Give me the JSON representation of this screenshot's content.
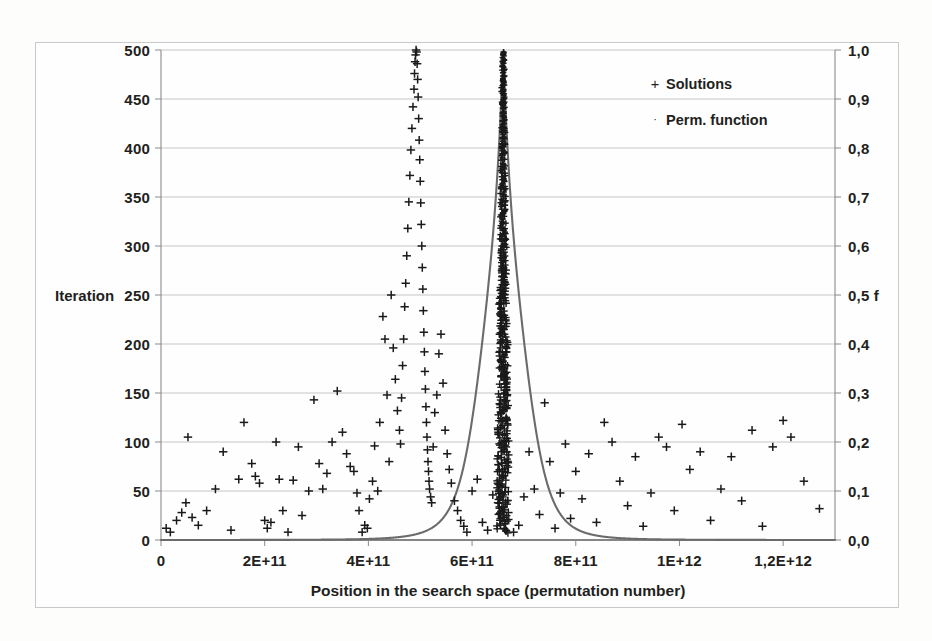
{
  "chart_data": {
    "type": "scatter",
    "title": "",
    "subtitle": "",
    "xlabel": "Position in the search space (permutation number)",
    "ylabel": "Iteration",
    "y2label": "f",
    "xlim": [
      0,
      1300000000000
    ],
    "ylim": [
      0,
      500
    ],
    "y2lim": [
      0,
      1.0
    ],
    "grid": true,
    "legend_position": "top-right",
    "xticks": [
      "0",
      "2E+11",
      "4E+11",
      "6E+11",
      "8E+11",
      "1E+12",
      "1,2E+12"
    ],
    "xtick_values": [
      0,
      200000000000,
      400000000000,
      600000000000,
      800000000000,
      1000000000000,
      1200000000000
    ],
    "yticks": [
      "0",
      "50",
      "100",
      "150",
      "200",
      "250",
      "300",
      "350",
      "400",
      "450",
      "500"
    ],
    "ytick_values": [
      0,
      50,
      100,
      150,
      200,
      250,
      300,
      350,
      400,
      450,
      500
    ],
    "y2ticks": [
      "0,0",
      "0,1",
      "0,2",
      "0,3",
      "0,4",
      "0,5 f",
      "0,6",
      "0,7",
      "0,8",
      "0,9",
      "1,0"
    ],
    "y2tick_values": [
      0.0,
      0.1,
      0.2,
      0.3,
      0.4,
      0.5,
      0.6,
      0.7,
      0.8,
      0.9,
      1.0
    ],
    "legend": [
      {
        "label": "Solutions",
        "marker": "+",
        "color": "#1a1a1a"
      },
      {
        "label": "Perm. function",
        "marker": "·",
        "color": "#5a5a5a"
      }
    ],
    "series": [
      {
        "name": "Solutions",
        "type": "scatter",
        "marker": "+",
        "color": "#1a1a1a",
        "axis": "left",
        "points": [
          [
            10000000000,
            12
          ],
          [
            18000000000,
            8
          ],
          [
            30000000000,
            20
          ],
          [
            40000000000,
            28
          ],
          [
            48000000000,
            38
          ],
          [
            52000000000,
            105
          ],
          [
            60000000000,
            23
          ],
          [
            72000000000,
            15
          ],
          [
            88000000000,
            30
          ],
          [
            105000000000,
            52
          ],
          [
            120000000000,
            90
          ],
          [
            135000000000,
            10
          ],
          [
            150000000000,
            62
          ],
          [
            160000000000,
            120
          ],
          [
            175000000000,
            78
          ],
          [
            182000000000,
            65
          ],
          [
            190000000000,
            58
          ],
          [
            200000000000,
            20
          ],
          [
            205000000000,
            12
          ],
          [
            212000000000,
            18
          ],
          [
            222000000000,
            100
          ],
          [
            228000000000,
            62
          ],
          [
            235000000000,
            30
          ],
          [
            245000000000,
            8
          ],
          [
            255000000000,
            61
          ],
          [
            265000000000,
            95
          ],
          [
            272000000000,
            25
          ],
          [
            285000000000,
            50
          ],
          [
            295000000000,
            143
          ],
          [
            305000000000,
            78
          ],
          [
            312000000000,
            52
          ],
          [
            320000000000,
            68
          ],
          [
            330000000000,
            100
          ],
          [
            340000000000,
            152
          ],
          [
            350000000000,
            110
          ],
          [
            358000000000,
            88
          ],
          [
            365000000000,
            75
          ],
          [
            372000000000,
            70
          ],
          [
            378000000000,
            48
          ],
          [
            382000000000,
            30
          ],
          [
            388000000000,
            8
          ],
          [
            393000000000,
            15
          ],
          [
            398000000000,
            12
          ],
          [
            402000000000,
            42
          ],
          [
            408000000000,
            60
          ],
          [
            412000000000,
            96
          ],
          [
            418000000000,
            50
          ],
          [
            422000000000,
            120
          ],
          [
            428000000000,
            228
          ],
          [
            432000000000,
            205
          ],
          [
            436000000000,
            148
          ],
          [
            440000000000,
            80
          ],
          [
            444000000000,
            250
          ],
          [
            448000000000,
            196
          ],
          [
            452000000000,
            164
          ],
          [
            456000000000,
            132
          ],
          [
            460000000000,
            112
          ],
          [
            462000000000,
            98
          ],
          [
            464000000000,
            145
          ],
          [
            466000000000,
            178
          ],
          [
            468000000000,
            205
          ],
          [
            470000000000,
            238
          ],
          [
            472000000000,
            262
          ],
          [
            474000000000,
            290
          ],
          [
            476000000000,
            318
          ],
          [
            478000000000,
            345
          ],
          [
            480000000000,
            372
          ],
          [
            482000000000,
            398
          ],
          [
            484000000000,
            420
          ],
          [
            486000000000,
            442
          ],
          [
            488000000000,
            460
          ],
          [
            489000000000,
            476
          ],
          [
            490000000000,
            488
          ],
          [
            491000000000,
            495
          ],
          [
            492000000000,
            500
          ],
          [
            493000000000,
            498
          ],
          [
            494000000000,
            486
          ],
          [
            495000000000,
            470
          ],
          [
            496000000000,
            452
          ],
          [
            497000000000,
            430
          ],
          [
            498000000000,
            408
          ],
          [
            499000000000,
            388
          ],
          [
            500000000000,
            366
          ],
          [
            501000000000,
            344
          ],
          [
            502000000000,
            322
          ],
          [
            503000000000,
            300
          ],
          [
            504000000000,
            278
          ],
          [
            505000000000,
            256
          ],
          [
            506000000000,
            234
          ],
          [
            507000000000,
            212
          ],
          [
            508000000000,
            192
          ],
          [
            509000000000,
            172
          ],
          [
            510000000000,
            154
          ],
          [
            511000000000,
            136
          ],
          [
            512000000000,
            120
          ],
          [
            513000000000,
            105
          ],
          [
            514000000000,
            92
          ],
          [
            515000000000,
            80
          ],
          [
            516000000000,
            70
          ],
          [
            517000000000,
            60
          ],
          [
            518000000000,
            52
          ],
          [
            520000000000,
            44
          ],
          [
            522000000000,
            38
          ],
          [
            525000000000,
            95
          ],
          [
            528000000000,
            130
          ],
          [
            532000000000,
            148
          ],
          [
            536000000000,
            190
          ],
          [
            540000000000,
            210
          ],
          [
            544000000000,
            160
          ],
          [
            548000000000,
            112
          ],
          [
            552000000000,
            88
          ],
          [
            556000000000,
            72
          ],
          [
            560000000000,
            58
          ],
          [
            566000000000,
            40
          ],
          [
            572000000000,
            30
          ],
          [
            578000000000,
            20
          ],
          [
            584000000000,
            14
          ],
          [
            590000000000,
            8
          ],
          [
            600000000000,
            50
          ],
          [
            610000000000,
            62
          ],
          [
            620000000000,
            18
          ],
          [
            630000000000,
            10
          ],
          [
            640000000000,
            46
          ],
          [
            650000000000,
            38
          ],
          [
            660000000000,
            132
          ],
          [
            670000000000,
            28
          ],
          [
            680000000000,
            8
          ],
          [
            690000000000,
            15
          ],
          [
            700000000000,
            44
          ],
          [
            710000000000,
            90
          ],
          [
            720000000000,
            52
          ],
          [
            730000000000,
            26
          ],
          [
            740000000000,
            140
          ],
          [
            750000000000,
            80
          ],
          [
            760000000000,
            12
          ],
          [
            770000000000,
            48
          ],
          [
            780000000000,
            98
          ],
          [
            790000000000,
            22
          ],
          [
            800000000000,
            70
          ],
          [
            812000000000,
            42
          ],
          [
            825000000000,
            88
          ],
          [
            840000000000,
            18
          ],
          [
            855000000000,
            120
          ],
          [
            870000000000,
            100
          ],
          [
            885000000000,
            60
          ],
          [
            900000000000,
            35
          ],
          [
            915000000000,
            85
          ],
          [
            930000000000,
            14
          ],
          [
            945000000000,
            48
          ],
          [
            960000000000,
            105
          ],
          [
            975000000000,
            95
          ],
          [
            990000000000,
            30
          ],
          [
            1005000000000,
            118
          ],
          [
            1020000000000,
            72
          ],
          [
            1040000000000,
            90
          ],
          [
            1060000000000,
            20
          ],
          [
            1080000000000,
            52
          ],
          [
            1100000000000,
            85
          ],
          [
            1120000000000,
            40
          ],
          [
            1140000000000,
            112
          ],
          [
            1160000000000,
            14
          ],
          [
            1180000000000,
            95
          ],
          [
            1200000000000,
            122
          ],
          [
            1215000000000,
            105
          ],
          [
            1240000000000,
            60
          ],
          [
            1270000000000,
            32
          ]
        ]
      },
      {
        "name": "Perm. function",
        "type": "line",
        "color": "#6b6b6b",
        "axis": "right",
        "description": "Sharp unimodal peak centred near 6.6E+11 reaching f = 1,0, decaying to near 0,0 on both tails",
        "peak_x": 660000000000,
        "peak_y": 1.0,
        "width_param": 30000000000
      }
    ]
  },
  "axis_titles": {
    "left": "Iteration",
    "bottom": "Position in the search space (permutation number)",
    "right": "f"
  }
}
